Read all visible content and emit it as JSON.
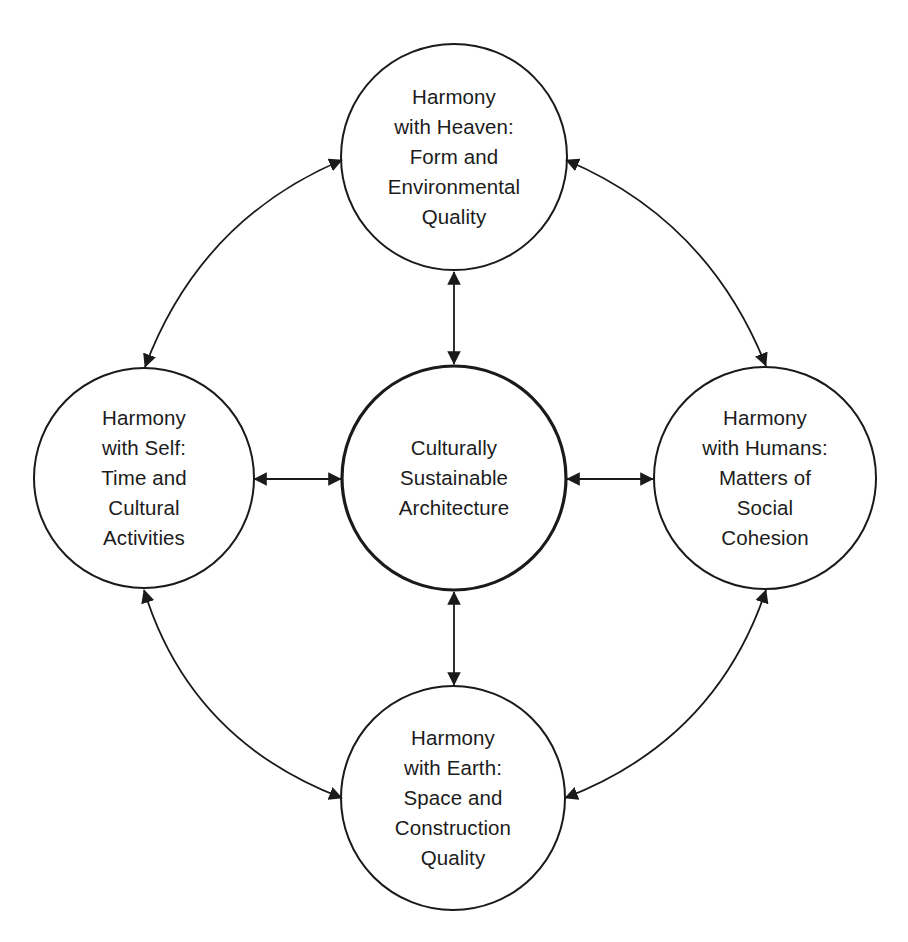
{
  "page": {
    "header_clipped": true
  },
  "diagram": {
    "type": "concept-map",
    "colors": {
      "stroke": "#1a1a1a",
      "background": "#ffffff",
      "text": "#1c1c1c"
    },
    "center_node": {
      "id": "center",
      "lines": [
        "Culturally",
        "Sustainable",
        "Architecture"
      ]
    },
    "nodes": {
      "top": {
        "id": "heaven",
        "lines": [
          "Harmony",
          "with Heaven:",
          "Form and",
          "Environmental",
          "Quality"
        ]
      },
      "left": {
        "id": "self",
        "lines": [
          "Harmony",
          "with Self:",
          "Time and",
          "Cultural",
          "Activities"
        ]
      },
      "right": {
        "id": "humans",
        "lines": [
          "Harmony",
          "with Humans:",
          "Matters of",
          "Social",
          "Cohesion"
        ]
      },
      "bottom": {
        "id": "earth",
        "lines": [
          "Harmony",
          "with Earth:",
          "Space and",
          "Construction",
          "Quality"
        ]
      }
    },
    "connections": [
      {
        "from": "center",
        "to": "heaven",
        "style": "straight",
        "bidirectional": true
      },
      {
        "from": "center",
        "to": "self",
        "style": "straight",
        "bidirectional": true
      },
      {
        "from": "center",
        "to": "humans",
        "style": "straight",
        "bidirectional": true
      },
      {
        "from": "center",
        "to": "earth",
        "style": "straight",
        "bidirectional": true
      },
      {
        "from": "heaven",
        "to": "self",
        "style": "curved",
        "bidirectional": true
      },
      {
        "from": "heaven",
        "to": "humans",
        "style": "curved",
        "bidirectional": true
      },
      {
        "from": "self",
        "to": "earth",
        "style": "curved",
        "bidirectional": true
      },
      {
        "from": "humans",
        "to": "earth",
        "style": "curved",
        "bidirectional": true
      }
    ]
  }
}
